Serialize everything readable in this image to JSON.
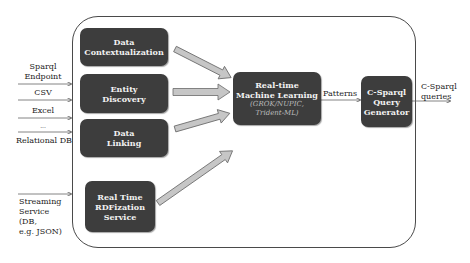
{
  "diagram": {
    "inputs": [
      {
        "label": "Sparql\nEndpoint",
        "lines": [
          "Sparql",
          "Endpoint"
        ]
      },
      {
        "label": "CSV",
        "lines": [
          "CSV"
        ]
      },
      {
        "label": "Excel",
        "lines": [
          "Excel"
        ]
      },
      {
        "label": "...",
        "lines": [
          "..."
        ]
      },
      {
        "label": "Relational DB",
        "lines": [
          "Relational DB"
        ]
      },
      {
        "label": "Streaming Service (DB, e.g. JSON)",
        "lines": [
          "Streaming",
          "Service",
          "(DB,",
          "e.g. JSON)"
        ]
      }
    ],
    "boxes": {
      "contextualization": {
        "lines": [
          "Data",
          "Contextualization"
        ]
      },
      "entity_discovery": {
        "lines": [
          "Entity",
          "Discovery"
        ]
      },
      "data_linking": {
        "lines": [
          "Data",
          "Linking"
        ]
      },
      "rdfization": {
        "lines": [
          "Real Time",
          "RDFization",
          "Service"
        ]
      },
      "ml": {
        "lines": [
          "Real-time",
          "Machine Learning"
        ],
        "sub": [
          "(GROK/NUPIC,",
          "Trident-ML)"
        ]
      },
      "csparql": {
        "lines": [
          "C-Sparql",
          "Query",
          "Generator"
        ]
      }
    },
    "edges": {
      "patterns_label": "Patterns",
      "output_lines": [
        "C-Sparql",
        "queries"
      ]
    },
    "colors": {
      "box_fill": "#3d3d3d",
      "box_text": "#f2f2f2",
      "arrow_fill": "#c6c6c6",
      "arrow_stroke": "#6a6a6a",
      "frame_stroke": "#4a4a4a"
    }
  }
}
